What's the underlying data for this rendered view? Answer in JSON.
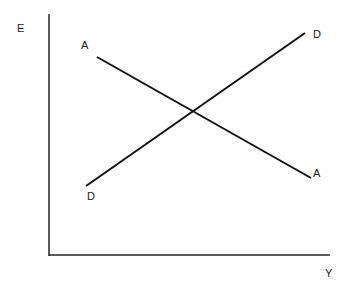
{
  "diagram": {
    "axes": {
      "y_label": "E",
      "x_label": "Y"
    },
    "lines": [
      {
        "id": "AA",
        "start_label": "A",
        "end_label": "A",
        "description": "downward sloping line",
        "from": [
          97,
          57
        ],
        "to": [
          311,
          178
        ]
      },
      {
        "id": "DD",
        "start_label": "D",
        "end_label": "D",
        "description": "upward sloping line",
        "from": [
          86,
          186
        ],
        "to": [
          305,
          33
        ]
      }
    ],
    "intersection": [
      193,
      111
    ],
    "colors": {
      "line": "#111111",
      "background": "#ffffff"
    }
  }
}
